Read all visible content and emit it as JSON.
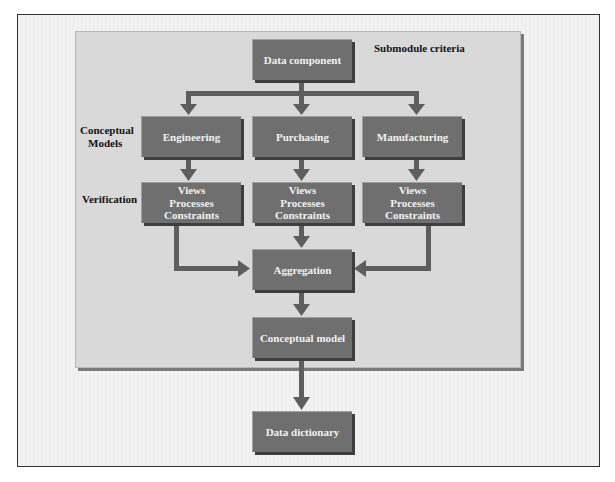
{
  "diagram": {
    "top_label": "Submodule criteria",
    "row_labels": {
      "conceptual_models": [
        "Conceptual",
        "Models"
      ],
      "verification": "Verification"
    },
    "nodes": {
      "data_component": "Data component",
      "engineering": "Engineering",
      "purchasing": "Purchasing",
      "manufacturing": "Manufacturing",
      "verification_boxes": [
        [
          "Views",
          "Processes",
          "Constraints"
        ],
        [
          "Views",
          "Processes",
          "Constraints"
        ],
        [
          "Views",
          "Processes",
          "Constraints"
        ]
      ],
      "aggregation": "Aggregation",
      "conceptual_model": "Conceptual model",
      "data_dictionary": "Data dictionary"
    },
    "colors": {
      "box_fill": "#6f6f6f",
      "arrow": "#5e5e5e",
      "panel": "#d9d9d9"
    }
  }
}
